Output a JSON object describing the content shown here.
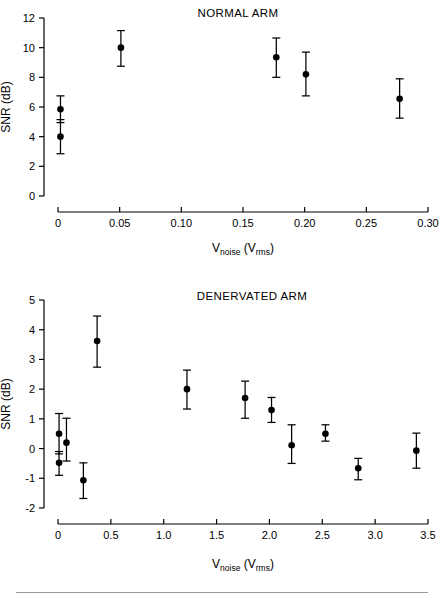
{
  "figure": {
    "axis_label_main": "V",
    "axis_label_sub": "noise",
    "axis_label_unit_open": " (V",
    "axis_label_unit_sub": "rms",
    "axis_label_unit_close": ")",
    "y_axis_title": "SNR (dB)",
    "ink_color": "#000000",
    "background_color": "#ffffff",
    "rule_color": "#9a9a9a"
  },
  "chart_data": [
    {
      "type": "scatter",
      "title": "NORMAL ARM",
      "xlabel": "V_noise (V_rms)",
      "ylabel": "SNR (dB)",
      "xlim": [
        0.0,
        0.3
      ],
      "ylim": [
        0,
        12
      ],
      "xticks": [
        0.0,
        0.05,
        0.1,
        0.15,
        0.2,
        0.25,
        0.3
      ],
      "xtick_labels": [
        "0",
        "0.05",
        "0.10",
        "0.15",
        "0.20",
        "0.25",
        "0.30"
      ],
      "yticks": [
        0,
        2,
        4,
        6,
        8,
        10,
        12
      ],
      "ytick_labels": [
        "0",
        "2",
        "4",
        "6",
        "8",
        "10",
        "12"
      ],
      "grid": false,
      "legend": "none",
      "error_bars": "symmetric-ish (y_low / y_high given)",
      "points": [
        {
          "x": 0.002,
          "y": 5.85,
          "y_low": 4.95,
          "y_high": 6.75
        },
        {
          "x": 0.002,
          "y": 4.0,
          "y_low": 2.85,
          "y_high": 5.15
        },
        {
          "x": 0.051,
          "y": 10.0,
          "y_low": 8.75,
          "y_high": 11.15
        },
        {
          "x": 0.177,
          "y": 9.35,
          "y_low": 8.0,
          "y_high": 10.65
        },
        {
          "x": 0.201,
          "y": 8.2,
          "y_low": 6.75,
          "y_high": 9.7
        },
        {
          "x": 0.277,
          "y": 6.55,
          "y_low": 5.25,
          "y_high": 7.9
        }
      ]
    },
    {
      "type": "scatter",
      "title": "DENERVATED ARM",
      "xlabel": "V_noise (V_rms)",
      "ylabel": "SNR (dB)",
      "xlim": [
        0.0,
        3.5
      ],
      "ylim": [
        -2,
        5
      ],
      "xticks": [
        0.0,
        0.5,
        1.0,
        1.5,
        2.0,
        2.5,
        3.0,
        3.5
      ],
      "xtick_labels": [
        "0",
        "0.5",
        "1.0",
        "1.5",
        "2.0",
        "2.5",
        "3.0",
        "3.5"
      ],
      "yticks": [
        -2,
        -1,
        0,
        1,
        2,
        3,
        4,
        5
      ],
      "ytick_labels": [
        "-2",
        "-1",
        "0",
        "1",
        "2",
        "3",
        "4",
        "5"
      ],
      "grid": false,
      "legend": "none",
      "error_bars": "symmetric-ish (y_low / y_high given)",
      "points": [
        {
          "x": 0.01,
          "y": 0.5,
          "y_low": -0.18,
          "y_high": 1.18
        },
        {
          "x": 0.01,
          "y": -0.48,
          "y_low": -0.9,
          "y_high": -0.1
        },
        {
          "x": 0.08,
          "y": 0.2,
          "y_low": -0.42,
          "y_high": 1.02
        },
        {
          "x": 0.24,
          "y": -1.07,
          "y_low": -1.68,
          "y_high": -0.48
        },
        {
          "x": 0.37,
          "y": 3.62,
          "y_low": 2.74,
          "y_high": 4.46
        },
        {
          "x": 1.22,
          "y": 2.0,
          "y_low": 1.33,
          "y_high": 2.64
        },
        {
          "x": 1.77,
          "y": 1.7,
          "y_low": 1.02,
          "y_high": 2.27
        },
        {
          "x": 2.02,
          "y": 1.3,
          "y_low": 0.88,
          "y_high": 1.72
        },
        {
          "x": 2.21,
          "y": 0.11,
          "y_low": -0.5,
          "y_high": 0.8
        },
        {
          "x": 2.53,
          "y": 0.5,
          "y_low": 0.25,
          "y_high": 0.8
        },
        {
          "x": 2.84,
          "y": -0.66,
          "y_low": -1.05,
          "y_high": -0.33
        },
        {
          "x": 3.39,
          "y": -0.07,
          "y_low": -0.66,
          "y_high": 0.52
        }
      ]
    }
  ]
}
